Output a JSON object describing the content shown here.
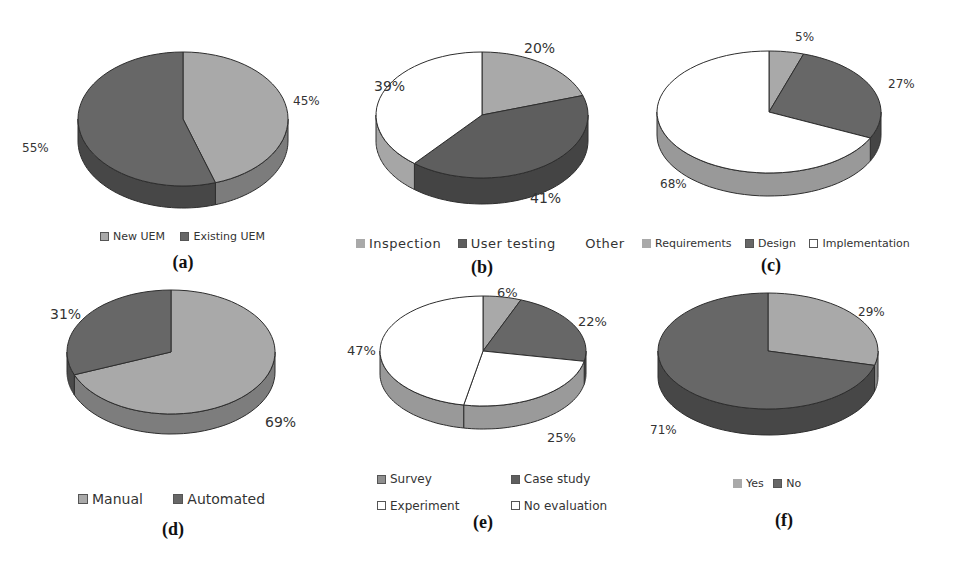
{
  "colors": {
    "light_gray": "#a9a9a9",
    "dark_gray": "#676767",
    "white": "#ffffff",
    "mid_gray": "#8f8f8f",
    "outline": "#333333"
  },
  "chart_data": [
    {
      "id": "a",
      "type": "pie",
      "caption": "(a)",
      "categories": [
        "New UEM",
        "Existing UEM"
      ],
      "values": [
        45,
        55
      ],
      "labels": [
        "45%",
        "55%"
      ],
      "colors": [
        "#a9a9a9",
        "#676767"
      ],
      "legend_position": "bottom"
    },
    {
      "id": "b",
      "type": "pie",
      "caption": "(b)",
      "categories": [
        "Inspection",
        "User testing",
        "Other"
      ],
      "values": [
        20,
        41,
        39
      ],
      "labels": [
        "20%",
        "41%",
        "39%"
      ],
      "colors": [
        "#a9a9a9",
        "#5e5e5e",
        "#ffffff"
      ],
      "legend_position": "bottom"
    },
    {
      "id": "c",
      "type": "pie",
      "caption": "(c)",
      "categories": [
        "Requirements",
        "Design",
        "Implementation"
      ],
      "values": [
        5,
        27,
        68
      ],
      "labels": [
        "5%",
        "27%",
        "68%"
      ],
      "colors": [
        "#a9a9a9",
        "#676767",
        "#ffffff"
      ],
      "legend_position": "bottom"
    },
    {
      "id": "d",
      "type": "pie",
      "caption": "(d)",
      "categories": [
        "Manual",
        "Automated"
      ],
      "values": [
        69,
        31
      ],
      "labels": [
        "69%",
        "31%"
      ],
      "colors": [
        "#a9a9a9",
        "#676767"
      ],
      "legend_position": "bottom"
    },
    {
      "id": "e",
      "type": "pie",
      "caption": "(e)",
      "categories": [
        "Survey",
        "Case study",
        "Experiment",
        "No evaluation"
      ],
      "values": [
        6,
        22,
        25,
        47
      ],
      "labels": [
        "6%",
        "22%",
        "25%",
        "47%"
      ],
      "colors": [
        "#a9a9a9",
        "#676767",
        "#ffffff",
        "#ffffff"
      ],
      "legend_position": "bottom"
    },
    {
      "id": "f",
      "type": "pie",
      "caption": "(f)",
      "categories": [
        "Yes",
        "No"
      ],
      "values": [
        29,
        71
      ],
      "labels": [
        "29%",
        "71%"
      ],
      "colors": [
        "#a9a9a9",
        "#676767"
      ],
      "legend_position": "bottom"
    }
  ]
}
